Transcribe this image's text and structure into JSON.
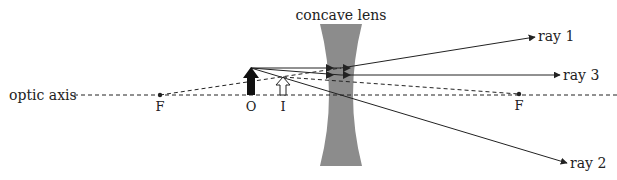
{
  "diagram": {
    "title": "concave lens",
    "axis_label": "optic axis",
    "focal_left_label": "F",
    "focal_right_label": "F",
    "object_label": "O",
    "image_label": "I",
    "rays": [
      {
        "label": "ray 1"
      },
      {
        "label": "ray 2"
      },
      {
        "label": "ray 3"
      }
    ],
    "colors": {
      "lens": "#8c8c8c",
      "lines": "#222222",
      "object": "#111111",
      "image_fill": "#ffffff"
    }
  }
}
